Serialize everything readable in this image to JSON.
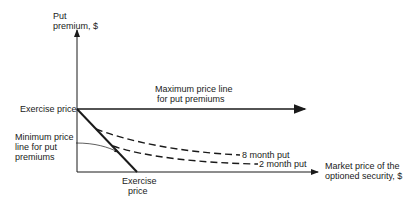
{
  "diagram": {
    "y_axis_label_line1": "Put",
    "y_axis_label_line2": "premium, $",
    "x_axis_label_line1": "Market price of the",
    "x_axis_label_line2": "optioned security, $",
    "y_tick_label": "Exercise price",
    "x_tick_label_line1": "Exercise",
    "x_tick_label_line2": "price",
    "max_line_label_line1": "Maximum price line",
    "max_line_label_line2": "for put premiums",
    "min_line_label_line1": "Minimum price",
    "min_line_label_line2": "line for put",
    "min_line_label_line3": "premiums",
    "series_8_month": "8 month put",
    "series_2_month": "2 month put"
  }
}
